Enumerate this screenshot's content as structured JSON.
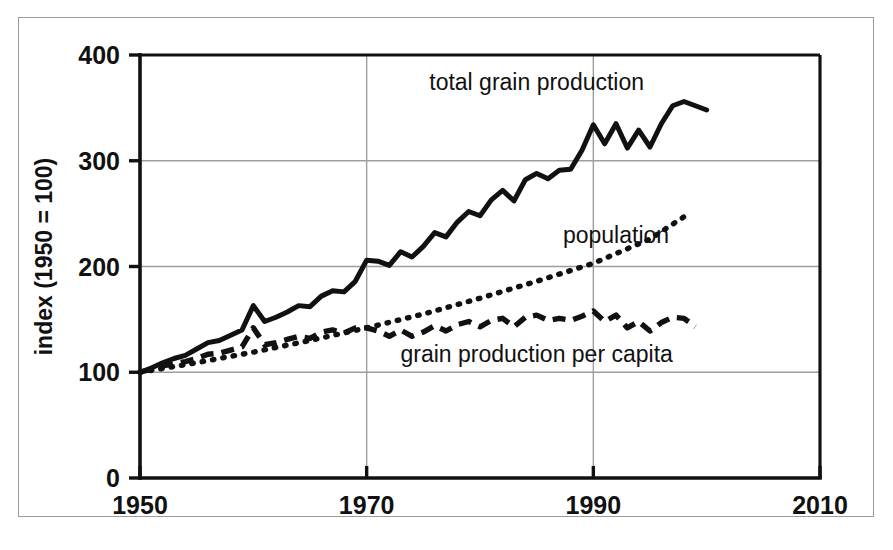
{
  "figure": {
    "width": 893,
    "height": 550,
    "background": "#ffffff",
    "frame_color": "#9a9a9a",
    "ink_color": "#111111",
    "grid_color": "#9d9d9d"
  },
  "chart_data": {
    "type": "line",
    "title": "",
    "subtitle": "",
    "xlabel": "",
    "ylabel": "index (1950 = 100)",
    "xlim": [
      1950,
      2010
    ],
    "ylim": [
      0,
      400
    ],
    "xticks": [
      1950,
      1970,
      1990,
      2010
    ],
    "yticks": [
      0,
      100,
      200,
      300,
      400
    ],
    "xtick_labels": [
      "1950",
      "1970",
      "1990",
      "2010"
    ],
    "ytick_labels": [
      "0",
      "100",
      "200",
      "300",
      "400"
    ],
    "grid": "vertical-and-horizontal-interior",
    "legend_position": "inline-annotations",
    "series": [
      {
        "name": "total grain production",
        "style": "solid",
        "annotation": "total grain production",
        "annotation_x": 1985,
        "annotation_y": 367,
        "x": [
          1950,
          1951,
          1952,
          1953,
          1954,
          1955,
          1956,
          1957,
          1958,
          1959,
          1960,
          1961,
          1962,
          1963,
          1964,
          1965,
          1966,
          1967,
          1968,
          1969,
          1970,
          1971,
          1972,
          1973,
          1974,
          1975,
          1976,
          1977,
          1978,
          1979,
          1980,
          1981,
          1982,
          1983,
          1984,
          1985,
          1986,
          1987,
          1988,
          1989,
          1990,
          1991,
          1992,
          1993,
          1994,
          1995,
          1996,
          1997,
          1998,
          1999,
          2000
        ],
        "values": [
          100,
          104,
          109,
          113,
          116,
          122,
          128,
          130,
          135,
          140,
          163,
          148,
          152,
          157,
          163,
          162,
          172,
          177,
          176,
          186,
          206,
          205,
          201,
          214,
          209,
          219,
          232,
          228,
          242,
          252,
          248,
          263,
          272,
          262,
          282,
          288,
          283,
          291,
          292,
          310,
          334,
          316,
          335,
          312,
          329,
          313,
          335,
          352,
          356,
          352,
          348
        ]
      },
      {
        "name": "population",
        "style": "dotted",
        "annotation": "population",
        "annotation_x": 1992,
        "annotation_y": 222,
        "x": [
          1950,
          1955,
          1960,
          1965,
          1970,
          1975,
          1980,
          1985,
          1990,
          1995,
          1998
        ],
        "values": [
          100,
          109,
          119,
          130,
          142,
          155,
          170,
          186,
          203,
          226,
          247
        ]
      },
      {
        "name": "grain production per capita",
        "style": "dashed",
        "annotation": "grain production per capita",
        "annotation_x": 1985,
        "annotation_y": 110,
        "x": [
          1950,
          1951,
          1952,
          1953,
          1954,
          1955,
          1956,
          1957,
          1958,
          1959,
          1960,
          1961,
          1962,
          1963,
          1964,
          1965,
          1966,
          1967,
          1968,
          1969,
          1970,
          1971,
          1972,
          1973,
          1974,
          1975,
          1976,
          1977,
          1978,
          1979,
          1980,
          1981,
          1982,
          1983,
          1984,
          1985,
          1986,
          1987,
          1988,
          1989,
          1990,
          1991,
          1992,
          1993,
          1994,
          1995,
          1996,
          1997,
          1998,
          1999
        ],
        "values": [
          100,
          103,
          106,
          108,
          110,
          113,
          117,
          118,
          121,
          124,
          142,
          126,
          128,
          131,
          134,
          132,
          138,
          140,
          137,
          142,
          142,
          139,
          134,
          140,
          134,
          138,
          144,
          139,
          145,
          148,
          143,
          149,
          151,
          143,
          152,
          154,
          149,
          151,
          149,
          153,
          158,
          148,
          154,
          142,
          148,
          139,
          147,
          152,
          151,
          143
        ]
      }
    ],
    "annotations": [
      {
        "text": "total grain production",
        "series": "total grain production"
      },
      {
        "text": "population",
        "series": "population"
      },
      {
        "text": "grain production per capita",
        "series": "grain production per capita"
      }
    ]
  }
}
